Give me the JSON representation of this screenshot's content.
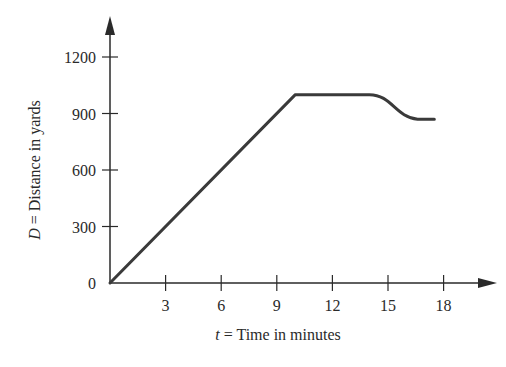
{
  "chart_data": {
    "type": "line",
    "title": "",
    "xlabel": "t = Time in minutes",
    "ylabel": "D = Distance in yards",
    "xlabel_var": "t",
    "xlabel_text": " = Time in minutes",
    "ylabel_var": "D",
    "ylabel_text": " = Distance in yards",
    "x_ticks": [
      3,
      6,
      9,
      12,
      15,
      18
    ],
    "y_ticks": [
      0,
      300,
      600,
      900,
      1200
    ],
    "xlim": [
      0,
      20
    ],
    "ylim": [
      0,
      1350
    ],
    "grid": false,
    "legend": null,
    "series": [
      {
        "name": "D(t)",
        "x": [
          0,
          10,
          14,
          14.5,
          15,
          15.5,
          16,
          16.5,
          17,
          17.5
        ],
        "y": [
          0,
          1000,
          1000,
          990,
          960,
          920,
          890,
          875,
          870,
          870
        ]
      }
    ]
  },
  "colors": {
    "axis": "#2a2a2a",
    "line": "#3a3a3a"
  }
}
